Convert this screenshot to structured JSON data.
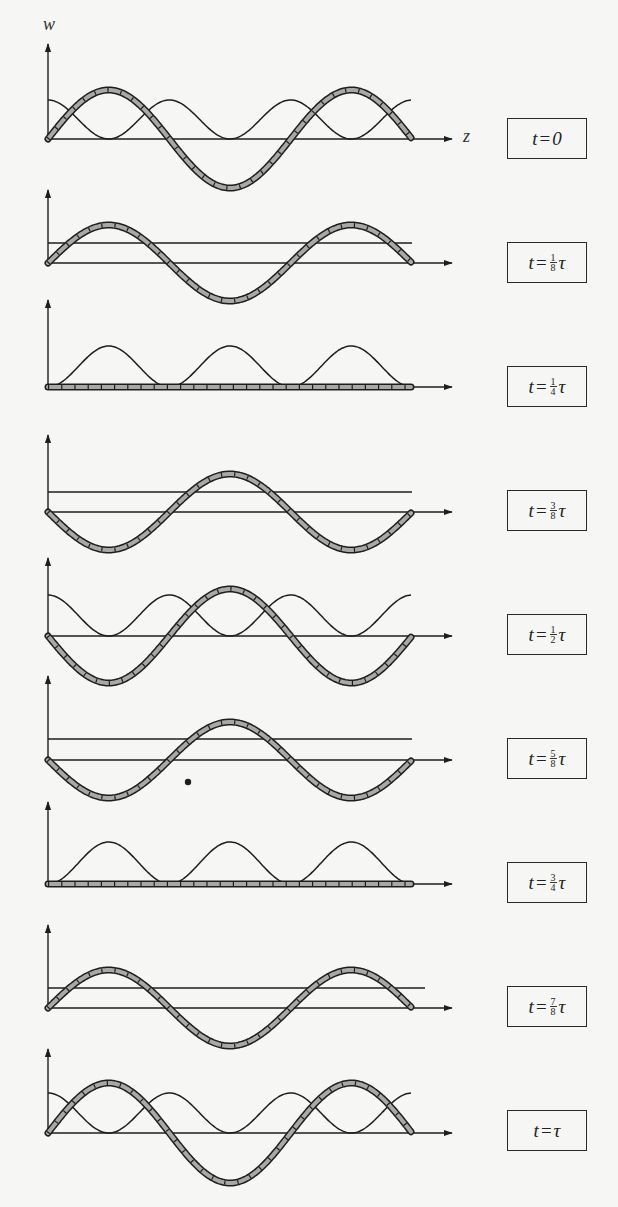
{
  "figure": {
    "axis_labels": {
      "vertical": "w",
      "horizontal": "z"
    },
    "dot": {
      "x": 188,
      "y": 782
    },
    "colors": {
      "ink": "#1e1e1e",
      "hatch_fill": "#a8a8a8",
      "background": "#f6f6f4"
    },
    "geometry": {
      "x0": 48,
      "x_end": 452,
      "wave_end": 412,
      "line_end": 412,
      "box_left": 507
    },
    "panels": [
      {
        "label_prefix": "t",
        "label_eq": "=",
        "label_num": "",
        "label_den": "",
        "label_tail": "0",
        "axis_y": 139,
        "top_y": 44,
        "box_y": 118,
        "hatched_amp": 49,
        "hatched_sign": 1,
        "thin": "rect_cos",
        "thin_amp": 39,
        "line_offset": 0,
        "show_z": true
      },
      {
        "label_prefix": "t",
        "label_eq": "=",
        "label_num": "1",
        "label_den": "8",
        "label_tail": "τ",
        "axis_y": 263,
        "top_y": 190,
        "box_y": 242,
        "hatched_amp": 38,
        "hatched_sign": 1,
        "thin": "line",
        "thin_amp": 0,
        "line_offset": 20,
        "show_z": false
      },
      {
        "label_prefix": "t",
        "label_eq": "=",
        "label_num": "1",
        "label_den": "4",
        "label_tail": "τ",
        "axis_y": 387,
        "top_y": 300,
        "box_y": 366,
        "hatched_amp": 0,
        "hatched_sign": 1,
        "thin": "bumps",
        "thin_amp": 41,
        "line_offset": 0,
        "show_z": false
      },
      {
        "label_prefix": "t",
        "label_eq": "=",
        "label_num": "3",
        "label_den": "8",
        "label_tail": "τ",
        "axis_y": 512,
        "top_y": 435,
        "box_y": 490,
        "hatched_amp": 38,
        "hatched_sign": -1,
        "thin": "line",
        "thin_amp": 0,
        "line_offset": 20,
        "show_z": false
      },
      {
        "label_prefix": "t",
        "label_eq": "=",
        "label_num": "1",
        "label_den": "2",
        "label_tail": "τ",
        "axis_y": 636,
        "top_y": 558,
        "box_y": 614,
        "hatched_amp": 47,
        "hatched_sign": -1,
        "thin": "rect_cos",
        "thin_amp": 41,
        "line_offset": 0,
        "show_z": false
      },
      {
        "label_prefix": "t",
        "label_eq": "=",
        "label_num": "5",
        "label_den": "8",
        "label_tail": "τ",
        "axis_y": 760,
        "top_y": 676,
        "box_y": 738,
        "hatched_amp": 38,
        "hatched_sign": -1,
        "thin": "line",
        "thin_amp": 0,
        "line_offset": 21,
        "show_z": false
      },
      {
        "label_prefix": "t",
        "label_eq": "=",
        "label_num": "3",
        "label_den": "4",
        "label_tail": "τ",
        "axis_y": 884,
        "top_y": 802,
        "box_y": 862,
        "hatched_amp": 0,
        "hatched_sign": 1,
        "thin": "bumps",
        "thin_amp": 42,
        "line_offset": 0,
        "show_z": false
      },
      {
        "label_prefix": "t",
        "label_eq": "=",
        "label_num": "7",
        "label_den": "8",
        "label_tail": "τ",
        "axis_y": 1008,
        "top_y": 925,
        "box_y": 986,
        "hatched_amp": 38,
        "hatched_sign": 1,
        "thin": "line",
        "thin_amp": 0,
        "line_offset": 20,
        "show_z": false
      },
      {
        "label_prefix": "t",
        "label_eq": "=",
        "label_num": "",
        "label_den": "",
        "label_tail": "τ",
        "axis_y": 1133,
        "top_y": 1049,
        "box_y": 1110,
        "hatched_amp": 50,
        "hatched_sign": 1,
        "thin": "rect_cos",
        "thin_amp": 40,
        "line_offset": 0,
        "show_z": false
      }
    ]
  }
}
